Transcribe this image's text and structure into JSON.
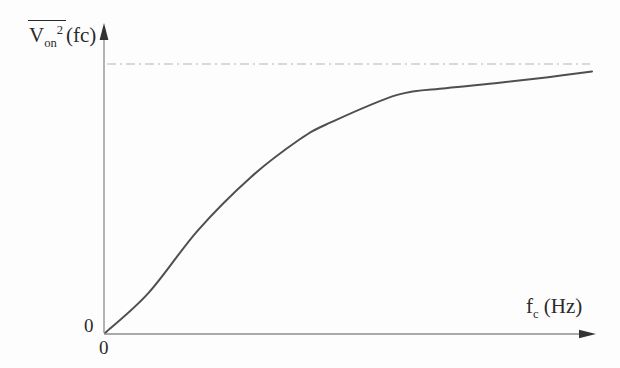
{
  "labels": {
    "y_base": "V",
    "y_sub": "on",
    "y_sup": "2",
    "y_suffix": "(fc)",
    "x_base": "f",
    "x_sub": "c",
    "x_unit": " (Hz)",
    "origin_y": "0",
    "origin_x": "0"
  },
  "colors": {
    "background": "#fdfdfd",
    "axis": "#8c8c8c",
    "arrow": "#333333",
    "curve": "#4f4f4f",
    "asymptote": "#b6b6b0",
    "text": "#2b2b2b"
  },
  "chart_data": {
    "type": "line",
    "title": "",
    "xlabel": "fc (Hz)",
    "ylabel": "V̄on²(fc)",
    "x_origin_label": "0",
    "y_origin_label": "0",
    "x": [
      0,
      0.09,
      0.19,
      0.3,
      0.4,
      0.46,
      0.6,
      0.7,
      0.81,
      0.91,
      1.0
    ],
    "series": [
      {
        "name": "mean-square noise voltage vs cutoff frequency",
        "values": [
          0,
          0.15,
          0.38,
          0.58,
          0.72,
          0.78,
          0.885,
          0.91,
          0.93,
          0.951,
          0.972
        ]
      }
    ],
    "asymptote_y": 1.0,
    "asymptote_style": "dash-dot",
    "xlim": [
      0,
      1.03
    ],
    "ylim": [
      0,
      1.12
    ],
    "grid": false,
    "legend": "none"
  }
}
